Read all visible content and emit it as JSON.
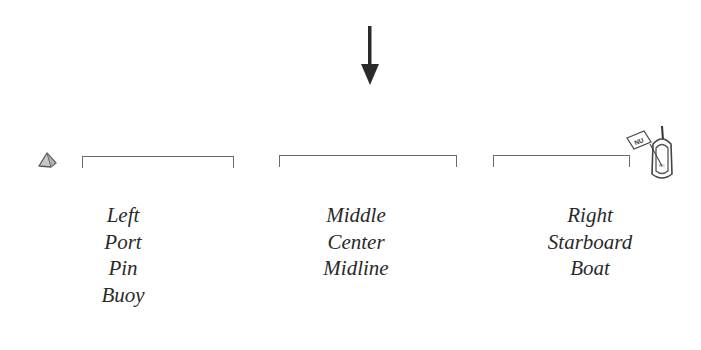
{
  "diagram": {
    "wind_arrow": {
      "icon": "down-arrow-icon",
      "color": "#2b2b2b"
    },
    "left_marker": {
      "icon": "buoy-icon",
      "fill": "#c8c8c8",
      "stroke": "#5a5a5a"
    },
    "right_marker": {
      "icon": "committee-boat-icon",
      "flag_text": "NU",
      "hull_text": "RC"
    },
    "line_color": "#6a6a6a",
    "sections": [
      {
        "id": "left",
        "labels": [
          "Left",
          "Port",
          "Pin",
          "Buoy"
        ]
      },
      {
        "id": "middle",
        "labels": [
          "Middle",
          "Center",
          "Midline"
        ]
      },
      {
        "id": "right",
        "labels": [
          "Right",
          "Starboard",
          "Boat"
        ]
      }
    ]
  }
}
